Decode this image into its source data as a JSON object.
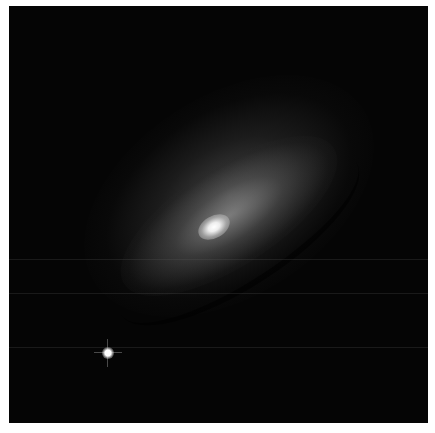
{
  "image": {
    "subject": "spiral galaxy",
    "background_color": "#050505",
    "border_color": "#ffffff"
  },
  "features": {
    "galaxy_core": {
      "x": 213,
      "y": 228
    },
    "foreground_star": {
      "x": 108,
      "y": 355
    }
  }
}
